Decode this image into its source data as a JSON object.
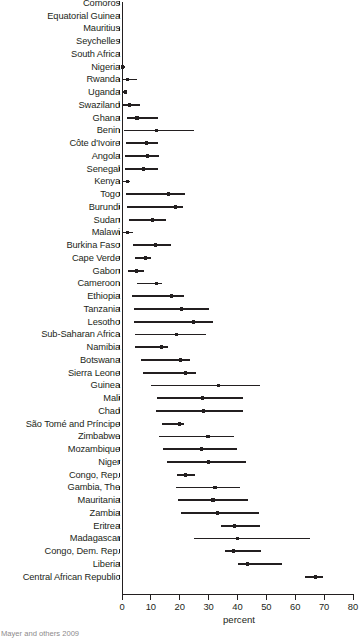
{
  "chart_data": {
    "type": "scatter",
    "title": "",
    "subtitle": "",
    "xlabel": "percent",
    "ylabel": "",
    "xlim": [
      0,
      80
    ],
    "ylim": null,
    "grid": false,
    "legend": null,
    "x_ticks": [
      0,
      10,
      20,
      30,
      40,
      50,
      60,
      70,
      80
    ],
    "x_tick_labels": [
      "0",
      "10",
      "20",
      "30",
      "40",
      "50",
      "60",
      "70",
      "80"
    ],
    "orientation": "horizontal",
    "marker": "point-with-range",
    "categories": [
      "Comoros",
      "Equatorial Guinea",
      "Mauritius",
      "Seychelles",
      "South Africa",
      "Nigeria",
      "Rwanda",
      "Uganda",
      "Swaziland",
      "Ghana",
      "Benin",
      "Côte d'Ivoire",
      "Angola",
      "Senegal",
      "Kenya",
      "Togo",
      "Burundi",
      "Sudan",
      "Malawi",
      "Burkina Faso",
      "Cape Verde",
      "Gabon",
      "Cameroon",
      "Ethiopia",
      "Tanzania",
      "Lesotho",
      "Sub-Saharan Africa",
      "Namibia",
      "Botswana",
      "Sierra Leone",
      "Guinea",
      "Mali",
      "Chad",
      "São Tomé and Príncipe",
      "Zimbabwe",
      "Mozambique",
      "Niger",
      "Congo, Rep.",
      "Gambia, The",
      "Mauritania",
      "Zambia",
      "Eritrea",
      "Madagascar",
      "Congo, Dem. Rep.",
      "Liberia",
      "Central African Republic"
    ],
    "series": [
      {
        "name": "point estimate (percent)",
        "values": [
          0.0,
          0.0,
          0.0,
          0.0,
          0.0,
          0.3,
          2.0,
          1.3,
          2.6,
          5.2,
          11.9,
          8.6,
          8.9,
          7.4,
          1.9,
          16.1,
          18.6,
          10.5,
          2.0,
          11.6,
          8.2,
          5.1,
          11.9,
          17.1,
          20.7,
          24.7,
          18.8,
          13.6,
          20.2,
          22.0,
          33.5,
          28.0,
          28.3,
          19.8,
          29.8,
          27.5,
          29.9,
          22.0,
          32.2,
          31.5,
          33.1,
          38.9,
          40.0,
          38.5,
          43.5,
          67.0
        ]
      },
      {
        "name": "range low (percent)",
        "values": [
          0.0,
          0.0,
          0.0,
          0.0,
          0.0,
          0.0,
          0.3,
          0.3,
          0.5,
          1.9,
          0.7,
          1.4,
          1.1,
          1.1,
          0.3,
          1.4,
          1.6,
          2.5,
          0.3,
          3.9,
          4.6,
          2.2,
          5.2,
          3.6,
          4.0,
          4.0,
          4.4,
          4.4,
          6.7,
          7.4,
          10.0,
          12.0,
          11.8,
          13.9,
          12.9,
          14.1,
          15.6,
          19.1,
          18.8,
          19.5,
          20.4,
          34.2,
          24.9,
          35.8,
          40.3,
          63.5
        ]
      },
      {
        "name": "range high (percent)",
        "values": [
          0.0,
          0.0,
          0.0,
          0.0,
          0.0,
          0.9,
          5.1,
          1.9,
          6.2,
          12.3,
          24.8,
          12.4,
          12.8,
          12.6,
          2.8,
          21.9,
          21.3,
          15.2,
          3.7,
          16.9,
          10.2,
          7.6,
          13.9,
          21.5,
          30.3,
          31.6,
          29.0,
          16.1,
          23.7,
          25.5,
          47.7,
          42.0,
          41.8,
          21.6,
          38.9,
          39.9,
          42.8,
          25.4,
          40.8,
          43.6,
          47.4,
          47.8,
          65.2,
          48.2,
          55.4,
          69.7
        ]
      }
    ]
  },
  "axis": {
    "x_title": "percent"
  },
  "footer": {
    "source": "Mayer and others 2009"
  }
}
